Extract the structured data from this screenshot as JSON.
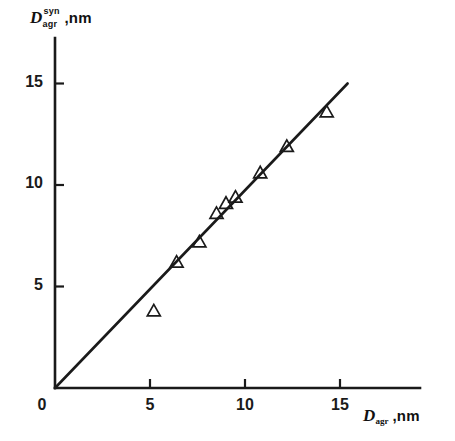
{
  "figure": {
    "background_color": "#ffffff",
    "ink_color": "#1a1a1a"
  },
  "y_axis_title": {
    "variable": "D",
    "superscript": "syn",
    "subscript": "agr",
    "units": ",nm",
    "full_text": "D_agr^syn ,nm"
  },
  "x_axis_title": {
    "variable": "D",
    "subscript": "agr",
    "units": ",nm",
    "full_text": "D_agr ,nm"
  },
  "origin_label": "0",
  "x_tick_labels": [
    "5",
    "10",
    "15"
  ],
  "y_tick_labels": [
    "5",
    "10",
    "15"
  ],
  "chart_data": {
    "type": "scatter",
    "title": "",
    "subtitle": "",
    "xlabel": "D_agr , nm",
    "ylabel": "D_agr^syn , nm",
    "xlim": [
      0,
      19.2
    ],
    "ylim": [
      0,
      17.2
    ],
    "xticks": [
      5,
      10,
      15
    ],
    "yticks": [
      5,
      10,
      15
    ],
    "grid": false,
    "legend": null,
    "legend_position": "none",
    "tick_direction": "in",
    "axis_style": "open-left-bottom",
    "marker": {
      "shape": "triangle-up",
      "fill": "none",
      "edge_color": "#1a1a1a",
      "size_px": 13
    },
    "series": [
      {
        "name": "synthesized vs aggregate diameter",
        "marker": "open-triangle",
        "points": [
          {
            "x": 5.2,
            "y": 3.8
          },
          {
            "x": 6.4,
            "y": 6.2
          },
          {
            "x": 7.6,
            "y": 7.2
          },
          {
            "x": 8.5,
            "y": 8.6
          },
          {
            "x": 9.0,
            "y": 9.1
          },
          {
            "x": 9.5,
            "y": 9.4
          },
          {
            "x": 10.8,
            "y": 10.6
          },
          {
            "x": 12.2,
            "y": 11.9
          },
          {
            "x": 14.3,
            "y": 13.6
          }
        ]
      }
    ],
    "reference_line": {
      "name": "identity line",
      "style": "solid",
      "width_px": 2.6,
      "color": "#1a1a1a",
      "from": {
        "x": 0,
        "y": 0
      },
      "to": {
        "x": 15.4,
        "y": 15.0
      }
    },
    "annotations": []
  },
  "geometry": {
    "origin_px": {
      "x": 55,
      "y": 388
    },
    "x_axis_end_px": 420,
    "y_axis_top_px": 38,
    "px_per_unit_x": 19.0,
    "px_per_unit_y": 20.3
  }
}
